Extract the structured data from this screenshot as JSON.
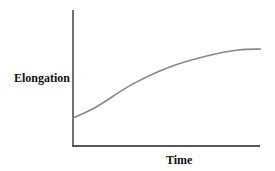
{
  "chart_data": {
    "type": "line",
    "title": "",
    "xlabel": "Time",
    "ylabel": "Elongation",
    "x_ticks": [],
    "y_ticks": [],
    "grid": false,
    "legend": null,
    "xlim": [
      0,
      1
    ],
    "ylim": [
      0,
      1
    ],
    "series": [
      {
        "name": "Elongation vs Time",
        "color": "#888888",
        "x": [
          0.0,
          0.117,
          0.303,
          0.489,
          0.676,
          0.835,
          0.947
        ],
        "y": [
          0.204,
          0.285,
          0.453,
          0.577,
          0.657,
          0.701,
          0.708
        ]
      }
    ]
  },
  "colors": {
    "axis": "#222222",
    "curve": "#888888",
    "text": "#111111"
  }
}
